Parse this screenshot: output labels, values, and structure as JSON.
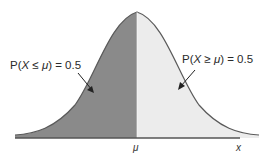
{
  "diagram": {
    "type": "normal-distribution-halves",
    "left_label": {
      "prefix": "P(",
      "var": "X",
      "op": " ≤ ",
      "mu": "μ",
      "suffix": ") = 0.5"
    },
    "right_label": {
      "prefix": "P(",
      "var": "X",
      "op": " ≥ ",
      "mu": "μ",
      "suffix": ") = 0.5"
    },
    "mean_label": "μ",
    "x_axis_label": "x",
    "colors": {
      "left_fill": "#8a8a8a",
      "right_fill": "#ececec",
      "curve": "#5a5a5a",
      "axis": "#555555"
    }
  }
}
